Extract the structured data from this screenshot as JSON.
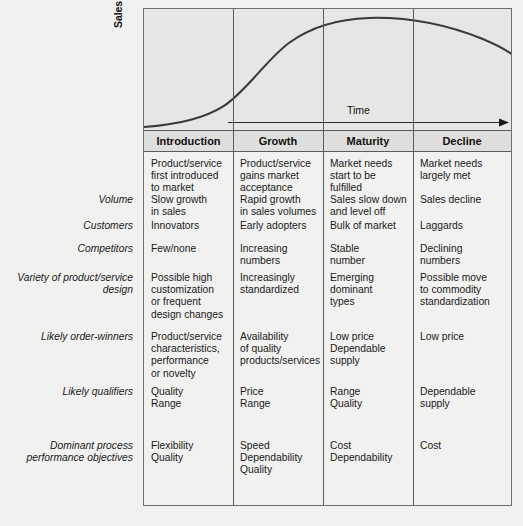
{
  "chart": {
    "y_axis_label": "Sales volume",
    "x_axis_label": "Time"
  },
  "chart_data": {
    "type": "line",
    "title": "",
    "subtitle": "",
    "xlabel": "Time",
    "ylabel": "Sales volume",
    "grid": false,
    "legend": "none",
    "annotations": [
      "Sales volume",
      "Time"
    ],
    "categories": [
      "Introduction",
      "Growth",
      "Maturity",
      "Decline"
    ],
    "xlim": [
      0,
      100
    ],
    "ylim": [
      0,
      100
    ],
    "series": [
      {
        "name": "Product life cycle sales volume",
        "x": [
          0,
          6,
          12,
          18,
          24,
          30,
          36,
          42,
          48,
          54,
          60,
          66,
          72,
          78,
          84,
          90,
          96,
          100
        ],
        "y": [
          2,
          3,
          5,
          8,
          13,
          20,
          30,
          42,
          55,
          67,
          77,
          85,
          90,
          93,
          94,
          92,
          85,
          72
        ]
      }
    ]
  },
  "matrix": {
    "column_headers": [
      "Introduction",
      "Growth",
      "Maturity",
      "Decline"
    ],
    "rows": [
      {
        "label": "",
        "cells": [
          [
            "Product/service",
            "first introduced",
            "to market"
          ],
          [
            "Product/service",
            "gains market",
            "acceptance"
          ],
          [
            "Market needs",
            "start to be",
            "fulfilled"
          ],
          [
            "Market needs",
            "largely met"
          ]
        ]
      },
      {
        "label": "Volume",
        "cells": [
          [
            "Slow growth",
            "in sales"
          ],
          [
            "Rapid growth",
            "in sales volumes"
          ],
          [
            "Sales slow down",
            "and level off"
          ],
          [
            "Sales decline"
          ]
        ]
      },
      {
        "label": "Customers",
        "cells": [
          [
            "Innovators"
          ],
          [
            "Early adopters"
          ],
          [
            "Bulk of market"
          ],
          [
            "Laggards"
          ]
        ]
      },
      {
        "label": "Competitors",
        "cells": [
          [
            "Few/none"
          ],
          [
            "Increasing",
            "numbers"
          ],
          [
            "Stable",
            "number"
          ],
          [
            "Declining",
            "numbers"
          ]
        ]
      },
      {
        "label": "Variety of product/service\ndesign",
        "label_lines": [
          "Variety of product/service",
          "design"
        ],
        "cells": [
          [
            "Possible high",
            "customization",
            "or frequent",
            "design changes"
          ],
          [
            "Increasingly",
            "standardized"
          ],
          [
            "Emerging",
            "dominant",
            "types"
          ],
          [
            "Possible move",
            "to commodity",
            "standardization"
          ]
        ]
      },
      {
        "label": "Likely order-winners",
        "label_lines": [
          "Likely order-winners"
        ],
        "cells": [
          [
            "Product/service",
            "characteristics,",
            "performance",
            "or novelty"
          ],
          [
            "Availability",
            "of quality",
            "products/services"
          ],
          [
            "Low price",
            "Dependable",
            "supply"
          ],
          [
            "Low price"
          ]
        ]
      },
      {
        "label": "Likely qualifiers",
        "label_lines": [
          "Likely qualifiers"
        ],
        "cells": [
          [
            "Quality",
            "Range"
          ],
          [
            "Price",
            "Range"
          ],
          [
            "Range",
            "Quality"
          ],
          [
            "Dependable",
            "supply"
          ]
        ]
      },
      {
        "label": "Dominant process\nperformance objectives",
        "label_lines": [
          "Dominant process",
          "performance objectives"
        ],
        "cells": [
          [
            "Flexibility",
            "Quality"
          ],
          [
            "Speed",
            "Dependability",
            "Quality"
          ],
          [
            "Cost",
            "Dependability"
          ],
          [
            "Cost"
          ]
        ]
      }
    ]
  },
  "colors": {
    "page_background": "#f1f1ef",
    "chart_background": "#e6e6e4",
    "header_background": "#dededc",
    "rule": "#5a5a5a",
    "curve": "#3a3a3a",
    "text": "#1a1a1a"
  }
}
